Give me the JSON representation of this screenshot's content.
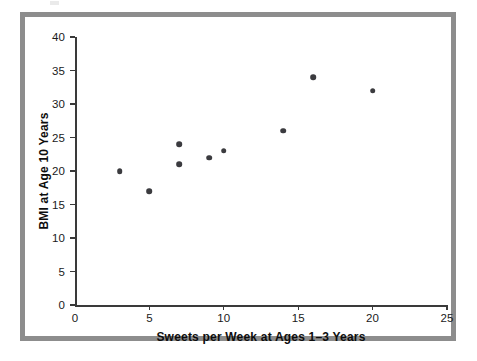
{
  "figure": {
    "frame_color": "#8d8d8d",
    "background_color": "#ffffff",
    "marker_color": "#3b3b3f",
    "axis_color": "#3a3a3a"
  },
  "chart_data": {
    "type": "scatter",
    "title": "",
    "xlabel": "Sweets per Week at Ages 1–3 Years",
    "ylabel": "BMI at Age 10 Years",
    "xlim": [
      0,
      25
    ],
    "ylim": [
      0,
      40
    ],
    "xticks": [
      0,
      5,
      10,
      15,
      20,
      25
    ],
    "yticks": [
      0,
      5,
      10,
      15,
      20,
      25,
      30,
      35,
      40
    ],
    "xticklabels": [
      "0",
      "5",
      "10",
      "15",
      "20",
      "25"
    ],
    "yticklabels": [
      "0",
      "5",
      "10",
      "15",
      "20",
      "25",
      "30",
      "35",
      "40"
    ],
    "grid": false,
    "legend": null,
    "series": [
      {
        "name": "Children",
        "marker": "circle",
        "color": "#3b3b3f",
        "points": [
          {
            "x": 3,
            "y": 20
          },
          {
            "x": 5,
            "y": 17
          },
          {
            "x": 7,
            "y": 24
          },
          {
            "x": 7,
            "y": 21
          },
          {
            "x": 9,
            "y": 22
          },
          {
            "x": 10,
            "y": 23
          },
          {
            "x": 14,
            "y": 26
          },
          {
            "x": 16,
            "y": 34
          },
          {
            "x": 20,
            "y": 32
          }
        ]
      }
    ]
  }
}
